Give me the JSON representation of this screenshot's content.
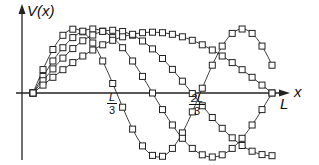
{
  "diagram": {
    "y_axis_label": "V(x)",
    "x_axis_label": "x",
    "end_label": "L",
    "ticks": [
      {
        "num": "L",
        "den": "3"
      },
      {
        "num": "2L",
        "den": "3"
      }
    ],
    "colors": {
      "line": "#222222",
      "marker_fill": "#ffffff",
      "marker_stroke": "#222222"
    },
    "geometry": {
      "origin_x": 33,
      "axis_y": 93,
      "L_x": 272,
      "y_axis_x": 22,
      "amplitude_px": 64
    },
    "curves": [
      {
        "name": "curve-1",
        "wavelength_frac": 0.7,
        "amplitude": 1.0
      },
      {
        "name": "curve-2",
        "wavelength_frac": 1.0,
        "amplitude": 1.0
      },
      {
        "name": "curve-3",
        "wavelength_frac": 1.33,
        "amplitude": 0.98
      },
      {
        "name": "curve-4",
        "wavelength_frac": 2.0,
        "amplitude": 0.95
      }
    ]
  }
}
